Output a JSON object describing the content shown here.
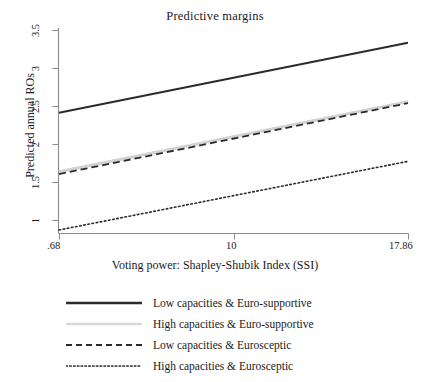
{
  "chart_data": {
    "type": "line",
    "title": "Predictive margins",
    "xlabel": "Voting power: Shapley-Shubik Index (SSI)",
    "ylabel": "Predicted annual ROs",
    "xlim": [
      0.68,
      17.86
    ],
    "ylim": [
      0.78,
      3.5
    ],
    "grid": false,
    "legend_position": "below",
    "xticks": [
      0.68,
      10,
      17.86
    ],
    "xtick_labels": [
      ".68",
      "10",
      "17.86"
    ],
    "yticks": [
      1,
      1.5,
      2,
      2.5,
      3,
      3.5
    ],
    "ytick_labels": [
      "1",
      "1.5",
      "2",
      "2.5",
      "3",
      "3.5"
    ],
    "x": [
      0.68,
      17.86
    ],
    "series": [
      {
        "name": "Low capacities & Euro-supportive",
        "style": "solid",
        "color": "#2b2b2b",
        "values": [
          2.39,
          3.33
        ]
      },
      {
        "name": "High capacities & Euro-supportive",
        "style": "solid-light",
        "color": "#d2d2d2",
        "values": [
          1.6,
          2.54
        ]
      },
      {
        "name": "Low capacities & Eurosceptic",
        "style": "dashed",
        "color": "#2b2b2b",
        "values": [
          1.57,
          2.52
        ]
      },
      {
        "name": "High capacities & Eurosceptic",
        "style": "dotted",
        "color": "#2b2b2b",
        "values": [
          0.82,
          1.74
        ]
      }
    ]
  },
  "legend": {
    "items": [
      {
        "label": "Low capacities & Euro-supportive",
        "key": "solid-line-key"
      },
      {
        "label": "High capacities & Euro-supportive",
        "key": "light-solid-line-key"
      },
      {
        "label": "Low capacities & Eurosceptic",
        "key": "dashed-line-key"
      },
      {
        "label": "High capacities & Eurosceptic",
        "key": "dotted-line-key"
      }
    ]
  },
  "axis": {
    "y_title": "Predicted annual ROs",
    "x_title": "Voting power: Shapley-Shubik Index (SSI)",
    "y_ticks": [
      "3.5",
      "3",
      "2.5",
      "2",
      "1.5",
      "1"
    ],
    "x_ticks": [
      ".68",
      "10",
      "17.86"
    ]
  },
  "colors": {
    "axis": "#8c8c8c",
    "ink": "#1b1b1b",
    "series_dark": "#2b2b2b",
    "series_light": "#d2d2d2",
    "background": "#ffffff"
  }
}
